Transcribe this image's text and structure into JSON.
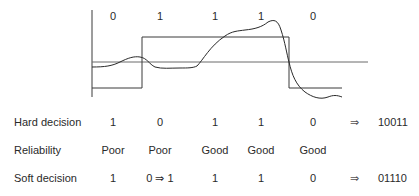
{
  "diagram": {
    "type": "soft-decision-waveform",
    "top_bits": [
      "0",
      "1",
      "1",
      "1",
      "0"
    ],
    "waveform": {
      "axis_color": "#3a3a3a",
      "threshold_color": "#6a6a6a",
      "square_wave_bits": [
        "0",
        "1",
        "1",
        "1",
        "0"
      ]
    }
  },
  "rows": [
    {
      "label": "Hard decision",
      "values": [
        "1",
        "0",
        "1",
        "1",
        "0"
      ],
      "arrow": "⇒",
      "result": "10011"
    },
    {
      "label": "Reliability",
      "values": [
        "Poor",
        "Poor",
        "Good",
        "Good",
        "Good"
      ],
      "arrow": "",
      "result": ""
    },
    {
      "label": "Soft decision",
      "values": [
        "1",
        "0 ⇒ 1",
        "1",
        "1",
        "0"
      ],
      "arrow": "⇒",
      "result": "01110"
    }
  ]
}
